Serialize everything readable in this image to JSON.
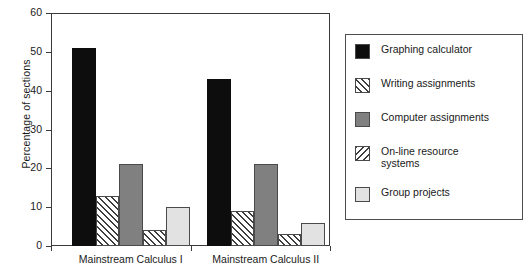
{
  "chart_data": {
    "type": "bar",
    "title": "",
    "subtitle": "",
    "xlabel": "",
    "ylabel": "Percentage of sections",
    "ylim": [
      0,
      60
    ],
    "yticks": [
      0,
      10,
      20,
      30,
      40,
      50,
      60
    ],
    "ytick_labels": [
      "0",
      "10",
      "20",
      "30",
      "40",
      "50",
      "60"
    ],
    "grid": false,
    "legend_position": "right",
    "categories": [
      "Mainstream Calculus I",
      "Mainstream Calculus II"
    ],
    "series": [
      {
        "name": "Graphing calculator",
        "values": [
          51,
          43
        ],
        "swatch": "sw-black",
        "color": "#0d0d0d"
      },
      {
        "name": "Writing assignments",
        "values": [
          13,
          9
        ],
        "swatch": "sw-hatch",
        "color": "#ffffff"
      },
      {
        "name": "Computer assignments",
        "values": [
          21,
          21
        ],
        "swatch": "sw-gray",
        "color": "#808080"
      },
      {
        "name": "On-line resource\nsystems",
        "values": [
          4,
          3
        ],
        "swatch": "sw-hatch2",
        "color": "#ffffff"
      },
      {
        "name": "Group projects",
        "values": [
          10,
          6
        ],
        "swatch": "sw-light",
        "color": "#e2e2e2"
      }
    ]
  },
  "legend": {
    "items": [
      {
        "label": "Graphing calculator"
      },
      {
        "label": "Writing assignments"
      },
      {
        "label": "Computer assignments"
      },
      {
        "label": "On-line resource\nsystems"
      },
      {
        "label": "Group projects"
      }
    ]
  },
  "axes": {
    "y_title": "Percentage of sections",
    "y_tick_labels": [
      "60",
      "50",
      "40",
      "30",
      "20",
      "10",
      "0"
    ],
    "x_group_labels": [
      "Mainstream Calculus I",
      "Mainstream Calculus II"
    ]
  },
  "colors": {
    "axis": "#3a3a3a",
    "text": "#1a1a1a",
    "black_bar": "#0d0d0d",
    "gray_bar": "#808080",
    "light_bar": "#e2e2e2",
    "hatch_line": "#3d3d3d",
    "background": "#ffffff"
  }
}
